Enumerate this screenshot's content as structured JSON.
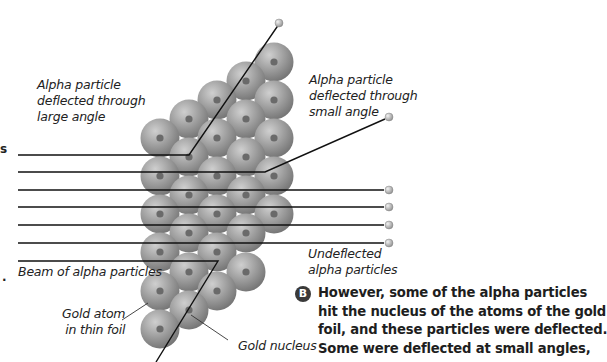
{
  "diagram": {
    "colors": {
      "atom_fill": "#8e8e8e",
      "atom_highlight": "#c4c4c4",
      "nucleus": "#6a6a6a",
      "path_line": "#111111",
      "alpha_particle": "#bdbdbd"
    },
    "labels": {
      "large_angle": [
        "Alpha particle",
        "deflected through",
        "large angle"
      ],
      "small_angle": [
        "Alpha particle",
        "deflected through",
        "small angle"
      ],
      "beam": "Beam of alpha particles",
      "undeflected": [
        "Undeflected",
        "alpha particles"
      ],
      "gold_atom": [
        "Gold atom",
        "in thin foil"
      ],
      "gold_nucleus": "Gold nucleus"
    },
    "caption": {
      "badge": "B",
      "lines": [
        "However, some of the alpha particles",
        "hit the nucleus of the atoms of the gold",
        "foil, and these particles were deflected.",
        "Some were deflected at small angles,"
      ]
    },
    "edge_marks": {
      "top": "s",
      "bottom": "."
    }
  }
}
